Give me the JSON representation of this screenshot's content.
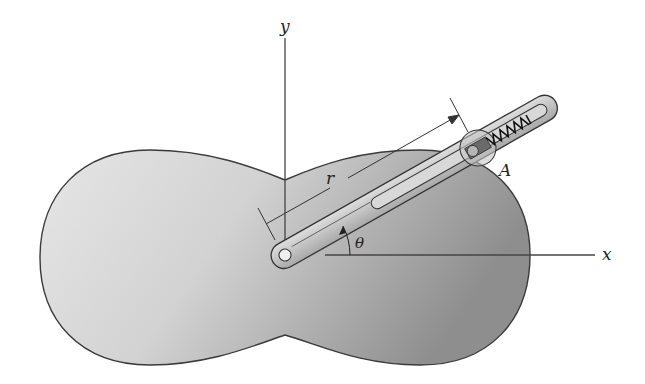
{
  "figure": {
    "labels": {
      "y_axis": "y",
      "x_axis": "x",
      "radius": "r",
      "angle": "θ",
      "point": "A"
    },
    "colors": {
      "plate_light": "#e4e4e4",
      "plate_dark": "#9a9a9a",
      "outline": "#3a3a3a",
      "arm": "#c9c9c9",
      "axis": "#444444",
      "background": "#ffffff"
    }
  }
}
